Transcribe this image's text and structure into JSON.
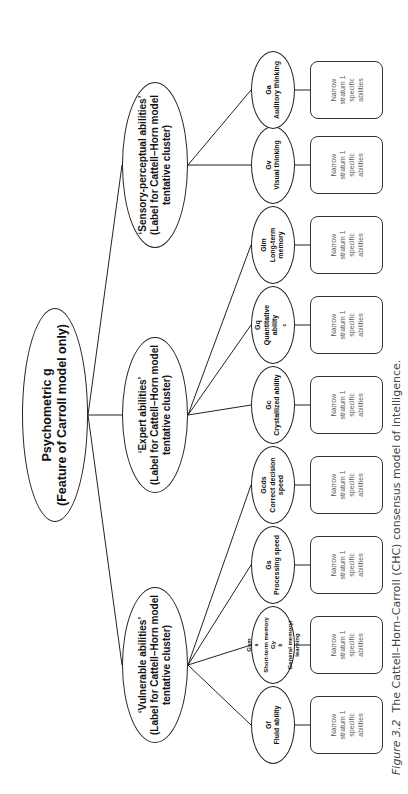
{
  "root": {
    "line1": "Psychometric g",
    "line2": "(Feature of Carroll model only)"
  },
  "clusters": [
    {
      "id": "vulnerable",
      "line1": "‘Vulnerable abilities’",
      "line2": "(Label for Cattell–Horn model",
      "line3": "tentative cluster)"
    },
    {
      "id": "expert",
      "line1": "‘Expert abilities’",
      "line2": "(Label for Cattell–Horn model",
      "line3": "tentative cluster)"
    },
    {
      "id": "sensory",
      "line1": "‘Sensory-perceptual abilities’",
      "line2": "(Label for Cattell–Horn model",
      "line3": "tentative cluster)"
    }
  ],
  "abilities": [
    {
      "code": "Gf",
      "name": "Fluid ability",
      "cluster": "vulnerable"
    },
    {
      "code": "Gsm",
      "sup": "a",
      "name": "Short-term memory",
      "code2": "Gy",
      "sup2": "b",
      "name2": "General memory/",
      "name3": "learning",
      "cluster": "vulnerable"
    },
    {
      "code": "Gs",
      "name": "Processing speed",
      "cluster": "vulnerable"
    },
    {
      "code": "Gcds",
      "name": "Correct decision",
      "name2": "speed",
      "cluster": "vulnerable"
    },
    {
      "code": "Gc",
      "name": "Crystallized ability",
      "cluster": "expert"
    },
    {
      "code": "Gq",
      "name": "Quantitative",
      "name2": "ability",
      "sup2": "c",
      "cluster": "expert"
    },
    {
      "code": "Glm",
      "name": "Long-term",
      "name2": "memory",
      "cluster": "expert"
    },
    {
      "code": "Gv",
      "name": "Visual thinking",
      "cluster": "sensory"
    },
    {
      "code": "Ga",
      "name": "Auditory thinking",
      "cluster": "sensory"
    }
  ],
  "narrow_box": {
    "line1": "Narrow",
    "line2": "stratum 1",
    "line3": "specific",
    "line4": "abilities"
  },
  "caption": {
    "label": "Figure 3.2",
    "text": "The Cattell–Horn–Carroll (CHC) consensus model of intelligence."
  }
}
